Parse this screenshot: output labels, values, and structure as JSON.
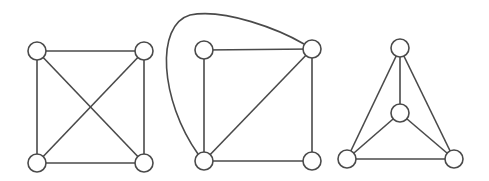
{
  "style": {
    "stroke_color": "#4a4a4a",
    "background": "#ffffff",
    "node_radius": 9
  },
  "graphs": [
    {
      "name": "k4-square-with-crossing-diagonals",
      "nodes": [
        {
          "id": "a",
          "x": 37,
          "y": 51
        },
        {
          "id": "b",
          "x": 144,
          "y": 51
        },
        {
          "id": "c",
          "x": 37,
          "y": 163
        },
        {
          "id": "d",
          "x": 144,
          "y": 163
        }
      ],
      "edges": [
        {
          "from": "a",
          "to": "b"
        },
        {
          "from": "c",
          "to": "d"
        },
        {
          "from": "a",
          "to": "c"
        },
        {
          "from": "b",
          "to": "d"
        },
        {
          "from": "a",
          "to": "d"
        },
        {
          "from": "b",
          "to": "c"
        }
      ]
    },
    {
      "name": "k4-square-with-curved-edge",
      "nodes": [
        {
          "id": "a",
          "x": 204,
          "y": 50
        },
        {
          "id": "b",
          "x": 312,
          "y": 49
        },
        {
          "id": "c",
          "x": 204,
          "y": 161
        },
        {
          "id": "d",
          "x": 312,
          "y": 161
        }
      ],
      "edges": [
        {
          "from": "a",
          "to": "b"
        },
        {
          "from": "c",
          "to": "d"
        },
        {
          "from": "a",
          "to": "c"
        },
        {
          "from": "b",
          "to": "d"
        },
        {
          "from": "b",
          "to": "c"
        }
      ],
      "curved_edges": [
        {
          "from": "c",
          "to": "b",
          "path": "M 198 154 C 160 100, 155 25, 190 15 C 225 8, 280 30, 304 44"
        }
      ]
    },
    {
      "name": "k4-triangle-with-center",
      "nodes": [
        {
          "id": "top",
          "x": 400,
          "y": 48
        },
        {
          "id": "center",
          "x": 400,
          "y": 113
        },
        {
          "id": "bl",
          "x": 347,
          "y": 159
        },
        {
          "id": "br",
          "x": 454,
          "y": 159
        }
      ],
      "edges": [
        {
          "from": "top",
          "to": "bl"
        },
        {
          "from": "top",
          "to": "br"
        },
        {
          "from": "bl",
          "to": "br"
        },
        {
          "from": "top",
          "to": "center"
        },
        {
          "from": "center",
          "to": "bl"
        },
        {
          "from": "center",
          "to": "br"
        }
      ]
    }
  ]
}
